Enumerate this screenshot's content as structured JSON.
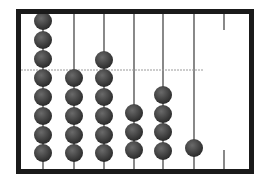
{
  "diagram": {
    "type": "abacus",
    "frame": {
      "left": 16,
      "top": 9,
      "right": 254,
      "bottom": 174,
      "thickness": 5,
      "color": "#1a1a1a"
    },
    "divider": {
      "y": 70,
      "x1": 21,
      "x2": 203,
      "color": "#9a9a9a",
      "style": "dashed"
    },
    "rod_color": "#3a3a3a",
    "bead_color": "#2b2b2b",
    "bead_highlight": "#6a6a6a",
    "bead_radius": 9,
    "rods": [
      {
        "x": 43,
        "full": true,
        "bead_count": 8,
        "bead_y": [
          21,
          40,
          59,
          78,
          97,
          116,
          135,
          153
        ]
      },
      {
        "x": 74,
        "full": true,
        "bead_count": 5,
        "bead_y": [
          78,
          97,
          116,
          135,
          153
        ]
      },
      {
        "x": 104,
        "full": true,
        "bead_count": 6,
        "bead_y": [
          60,
          78,
          97,
          116,
          135,
          153
        ]
      },
      {
        "x": 134,
        "full": true,
        "bead_count": 3,
        "bead_y": [
          113,
          132,
          150
        ]
      },
      {
        "x": 163,
        "full": true,
        "bead_count": 4,
        "bead_y": [
          95,
          114,
          132,
          151
        ]
      },
      {
        "x": 194,
        "full": true,
        "bead_count": 1,
        "bead_y": [
          148
        ]
      },
      {
        "x": 224,
        "full": false,
        "bead_count": 0,
        "bead_y": [],
        "stub_top": [
          13,
          30
        ],
        "stub_bottom": [
          150,
          170
        ]
      }
    ]
  }
}
